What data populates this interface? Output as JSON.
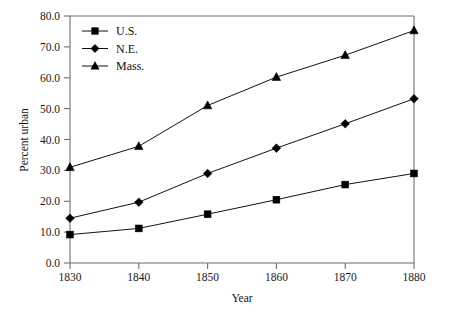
{
  "chart_data": {
    "type": "line",
    "title": "",
    "xlabel": "Year",
    "ylabel": "Percent urban",
    "x": [
      1830,
      1840,
      1850,
      1860,
      1870,
      1880
    ],
    "xtick_labels": [
      "1830",
      "1840",
      "1850",
      "1860",
      "1870",
      "1880"
    ],
    "ytick_labels": [
      "0.0",
      "10.0",
      "20.0",
      "30.0",
      "40.0",
      "50.0",
      "60.0",
      "70.0",
      "80.0"
    ],
    "yticks": [
      0,
      10,
      20,
      30,
      40,
      50,
      60,
      70,
      80
    ],
    "xlim": [
      1830,
      1880
    ],
    "ylim": [
      0,
      80
    ],
    "grid": false,
    "legend_position": "upper-left",
    "series": [
      {
        "name": "U.S.",
        "marker": "square",
        "color": "#000000",
        "values": [
          9.2,
          11.2,
          15.8,
          20.5,
          25.4,
          29.0
        ]
      },
      {
        "name": "N.E.",
        "marker": "diamond",
        "color": "#000000",
        "values": [
          14.5,
          19.7,
          29.0,
          37.2,
          45.1,
          53.2
        ]
      },
      {
        "name": "Mass.",
        "marker": "triangle",
        "color": "#000000",
        "values": [
          31.0,
          37.8,
          51.0,
          60.2,
          67.3,
          75.3
        ]
      }
    ]
  },
  "legend": {
    "entries": [
      {
        "label": "U.S."
      },
      {
        "label": "N.E."
      },
      {
        "label": "Mass."
      }
    ]
  },
  "axes": {
    "x_title": "Year",
    "y_title": "Percent urban"
  },
  "colors": {
    "ink": "#111111",
    "frame": "#6e6e6e",
    "background": "#ffffff"
  }
}
